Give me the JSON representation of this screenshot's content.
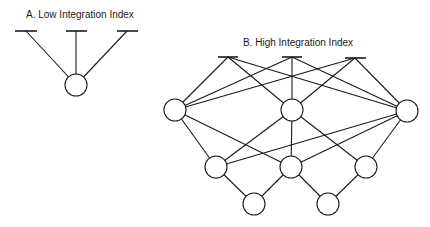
{
  "diagrams": [
    {
      "id": "A",
      "title": "A.  Low Integration Index",
      "title_pos": [
        26,
        18
      ],
      "node_radius": 11,
      "top_bars": [
        {
          "x1": 15,
          "x2": 37,
          "y": 31,
          "apex": [
            26,
            31
          ]
        },
        {
          "x1": 66,
          "x2": 87,
          "y": 31,
          "apex": [
            76,
            31
          ]
        },
        {
          "x1": 117,
          "x2": 138,
          "y": 31,
          "apex": [
            127,
            31
          ]
        }
      ],
      "nodes": [
        {
          "cx": 76,
          "cy": 85
        }
      ],
      "edges": [
        {
          "from": "bar0",
          "to": "node0"
        },
        {
          "from": "bar1",
          "to": "node0"
        },
        {
          "from": "bar2",
          "to": "node0"
        }
      ]
    },
    {
      "id": "B",
      "title": "B.  High Integration Index",
      "title_pos": [
        243,
        46
      ],
      "node_radius": 11,
      "top_bars": [
        {
          "x1": 218,
          "x2": 238,
          "y": 57,
          "apex": [
            228,
            57
          ]
        },
        {
          "x1": 282,
          "x2": 302,
          "y": 57,
          "apex": [
            292,
            57
          ]
        },
        {
          "x1": 345,
          "x2": 366,
          "y": 58,
          "apex": [
            355,
            58
          ]
        }
      ],
      "nodes": [
        {
          "cx": 175,
          "cy": 110
        },
        {
          "cx": 292,
          "cy": 110
        },
        {
          "cx": 407,
          "cy": 111
        },
        {
          "cx": 216,
          "cy": 167
        },
        {
          "cx": 291,
          "cy": 167
        },
        {
          "cx": 366,
          "cy": 167
        },
        {
          "cx": 254,
          "cy": 204
        },
        {
          "cx": 328,
          "cy": 204
        }
      ],
      "edges": [
        {
          "from": "bar0",
          "to": "node0"
        },
        {
          "from": "bar0",
          "to": "node1"
        },
        {
          "from": "bar0",
          "to": "node2"
        },
        {
          "from": "bar1",
          "to": "node0"
        },
        {
          "from": "bar1",
          "to": "node1"
        },
        {
          "from": "bar1",
          "to": "node2"
        },
        {
          "from": "bar2",
          "to": "node0"
        },
        {
          "from": "bar2",
          "to": "node1"
        },
        {
          "from": "bar2",
          "to": "node2"
        },
        {
          "from": "node0",
          "to": "node3"
        },
        {
          "from": "node0",
          "to": "node4"
        },
        {
          "from": "node1",
          "to": "node3"
        },
        {
          "from": "node1",
          "to": "node4"
        },
        {
          "from": "node1",
          "to": "node5"
        },
        {
          "from": "node2",
          "to": "node3"
        },
        {
          "from": "node2",
          "to": "node4"
        },
        {
          "from": "node2",
          "to": "node5"
        },
        {
          "from": "node3",
          "to": "node6"
        },
        {
          "from": "node4",
          "to": "node6"
        },
        {
          "from": "node4",
          "to": "node7"
        },
        {
          "from": "node5",
          "to": "node7"
        }
      ]
    }
  ]
}
